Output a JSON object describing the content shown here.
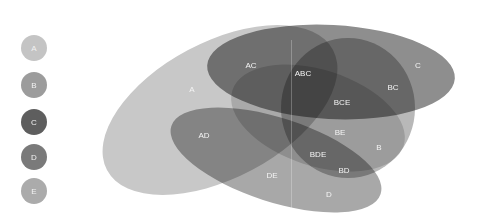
{
  "legend": [
    {
      "label": "A",
      "color": "#c4c4c4"
    },
    {
      "label": "B",
      "color": "#9c9c9c"
    },
    {
      "label": "C",
      "color": "#5e5e5e"
    },
    {
      "label": "D",
      "color": "#7a7a7a"
    },
    {
      "label": "E",
      "color": "#ababab"
    }
  ],
  "sets": {
    "A": {
      "color": "#c8c8c8"
    },
    "B": {
      "color": "#9c9c9c"
    },
    "C": {
      "color": "#6a6a6a"
    },
    "D": {
      "color": "#858585"
    },
    "E": {
      "color": "#b0b0b0"
    }
  },
  "regions": [
    {
      "label": "A",
      "x": 192,
      "y": 89
    },
    {
      "label": "AC",
      "x": 251,
      "y": 65
    },
    {
      "label": "ABC",
      "x": 303,
      "y": 73
    },
    {
      "label": "C",
      "x": 418,
      "y": 65
    },
    {
      "label": "BC",
      "x": 393,
      "y": 87
    },
    {
      "label": "BCE",
      "x": 342,
      "y": 102
    },
    {
      "label": "AD",
      "x": 204,
      "y": 135
    },
    {
      "label": "BE",
      "x": 340,
      "y": 132
    },
    {
      "label": "B",
      "x": 379,
      "y": 147
    },
    {
      "label": "BDE",
      "x": 318,
      "y": 154
    },
    {
      "label": "BD",
      "x": 344,
      "y": 170
    },
    {
      "label": "DE",
      "x": 272,
      "y": 175
    },
    {
      "label": "D",
      "x": 329,
      "y": 194
    }
  ]
}
